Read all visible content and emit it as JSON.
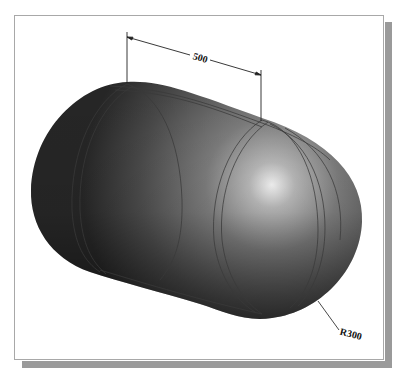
{
  "figure": {
    "dimensions": {
      "length_label": "500",
      "radius_label": "R300"
    },
    "colors": {
      "frame_border": "#a8a8a8",
      "shadow": "#9a9a9a",
      "body_dark": "#2e2e2e",
      "body_mid": "#777777",
      "highlight": "#f2f2f2",
      "edge_lines": "#3a3a3a",
      "dimension_lines": "#222222"
    }
  }
}
